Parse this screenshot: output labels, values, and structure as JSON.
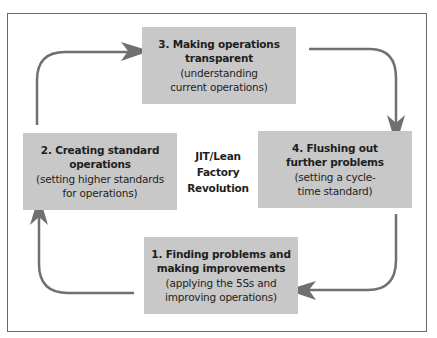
{
  "diagram": {
    "center_label": [
      "JIT/Lean",
      "Factory",
      "Revolution"
    ],
    "steps": [
      {
        "id": 1,
        "title": [
          "1. Finding problems and",
          "making improvements"
        ],
        "subtitle": [
          "(applying the 5Ss and",
          "improving operations)"
        ]
      },
      {
        "id": 2,
        "title": [
          "2. Creating standard",
          "operations"
        ],
        "subtitle": [
          "(setting higher standards",
          "for operations)"
        ]
      },
      {
        "id": 3,
        "title": [
          "3. Making operations",
          "transparent"
        ],
        "subtitle": [
          "(understanding",
          "current operations)"
        ]
      },
      {
        "id": 4,
        "title": [
          "4. Flushing out",
          "further problems"
        ],
        "subtitle": [
          "(setting a cycle-",
          "time standard)"
        ]
      }
    ],
    "flow": [
      "1 -> 2",
      "2 -> 3",
      "3 -> 4",
      "4 -> 1"
    ],
    "colors": {
      "box_fill": "#c8c8c8",
      "arrow": "#707070",
      "frame": "#6a6a6a"
    }
  }
}
